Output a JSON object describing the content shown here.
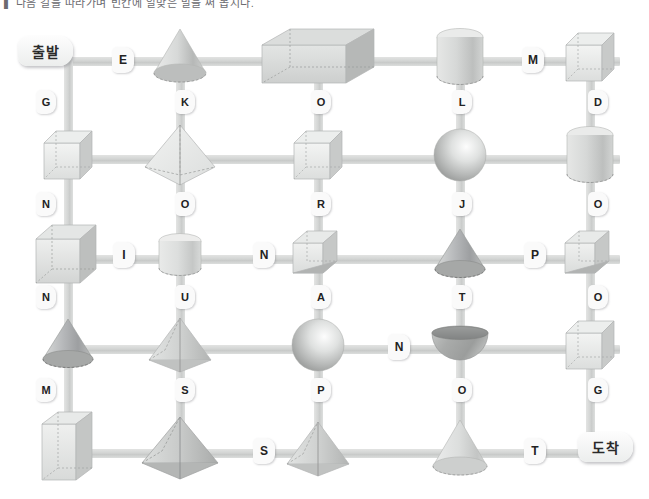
{
  "page": {
    "title_strip": "▌ 다음 길을 따라가며 빈칸에 알맞은 말을 써 봅시다.",
    "background_color": "#ffffff",
    "bar_color": "#d3d5d4",
    "chip_color": "#fafafa"
  },
  "terminals": {
    "start": {
      "label": "출발",
      "x": 18,
      "y": 36
    },
    "end": {
      "label": "도착",
      "x": 578,
      "y": 432
    }
  },
  "grid": {
    "columns": 5,
    "rows": 5,
    "column_x": [
      68,
      180,
      318,
      460,
      590
    ],
    "row_y": [
      60,
      158,
      258,
      348,
      452
    ]
  },
  "shapes": [
    {
      "row": 1,
      "col": 1,
      "kind": "none"
    },
    {
      "row": 1,
      "col": 2,
      "kind": "cone",
      "name": "cone"
    },
    {
      "row": 1,
      "col": 3,
      "kind": "cuboid-wide",
      "name": "rectangular-prism"
    },
    {
      "row": 1,
      "col": 4,
      "kind": "cylinder",
      "name": "cylinder"
    },
    {
      "row": 1,
      "col": 5,
      "kind": "cube",
      "name": "cube"
    },
    {
      "row": 2,
      "col": 1,
      "kind": "cube",
      "name": "cube"
    },
    {
      "row": 2,
      "col": 2,
      "kind": "octahedron",
      "name": "octahedron"
    },
    {
      "row": 2,
      "col": 3,
      "kind": "cube",
      "name": "cube"
    },
    {
      "row": 2,
      "col": 4,
      "kind": "sphere",
      "name": "sphere"
    },
    {
      "row": 2,
      "col": 5,
      "kind": "cylinder",
      "name": "cylinder"
    },
    {
      "row": 3,
      "col": 1,
      "kind": "cube-large",
      "name": "cube"
    },
    {
      "row": 3,
      "col": 2,
      "kind": "cylinder-short",
      "name": "cylinder"
    },
    {
      "row": 3,
      "col": 3,
      "kind": "triangular-prism",
      "name": "triangular-prism"
    },
    {
      "row": 3,
      "col": 4,
      "kind": "cone-dark",
      "name": "cone"
    },
    {
      "row": 3,
      "col": 5,
      "kind": "triangular-prism",
      "name": "triangular-prism"
    },
    {
      "row": 4,
      "col": 1,
      "kind": "cone-dark",
      "name": "cone"
    },
    {
      "row": 4,
      "col": 2,
      "kind": "pyramid",
      "name": "square-pyramid"
    },
    {
      "row": 4,
      "col": 3,
      "kind": "sphere",
      "name": "sphere"
    },
    {
      "row": 4,
      "col": 4,
      "kind": "hemisphere",
      "name": "hemisphere"
    },
    {
      "row": 4,
      "col": 5,
      "kind": "cube",
      "name": "cube"
    },
    {
      "row": 5,
      "col": 1,
      "kind": "cuboid-tall",
      "name": "rectangular-prism"
    },
    {
      "row": 5,
      "col": 2,
      "kind": "pyramid-big",
      "name": "square-pyramid"
    },
    {
      "row": 5,
      "col": 3,
      "kind": "pyramid",
      "name": "square-pyramid"
    },
    {
      "row": 5,
      "col": 4,
      "kind": "cone-tall",
      "name": "cone"
    },
    {
      "row": 5,
      "col": 5,
      "kind": "none"
    }
  ],
  "horizontal_labels": [
    {
      "id": "h-r1-1",
      "letter": "E",
      "row": 1,
      "x": 112,
      "y": 47
    },
    {
      "id": "h-r1-2",
      "letter": "M",
      "row": 1,
      "x": 522,
      "y": 47
    },
    {
      "id": "h-r3-1",
      "letter": "I",
      "row": 3,
      "x": 113,
      "y": 242
    },
    {
      "id": "h-r3-2",
      "letter": "N",
      "row": 3,
      "x": 253,
      "y": 242
    },
    {
      "id": "h-r3-3",
      "letter": "P",
      "row": 3,
      "x": 524,
      "y": 242
    },
    {
      "id": "h-r4-1",
      "letter": "N",
      "row": 4,
      "x": 388,
      "y": 334
    },
    {
      "id": "h-r5-1",
      "letter": "S",
      "row": 5,
      "x": 253,
      "y": 438
    },
    {
      "id": "h-r5-2",
      "letter": "T",
      "row": 5,
      "x": 524,
      "y": 438
    }
  ],
  "vertical_labels": [
    {
      "id": "v-1-1",
      "letter": "G",
      "col": 1,
      "x": 36,
      "y": 90
    },
    {
      "id": "v-1-2",
      "letter": "K",
      "col": 2,
      "x": 175,
      "y": 90
    },
    {
      "id": "v-1-3",
      "letter": "O",
      "col": 3,
      "x": 311,
      "y": 90
    },
    {
      "id": "v-1-4",
      "letter": "L",
      "col": 4,
      "x": 452,
      "y": 90
    },
    {
      "id": "v-1-5",
      "letter": "D",
      "col": 5,
      "x": 588,
      "y": 90
    },
    {
      "id": "v-2-1",
      "letter": "N",
      "col": 1,
      "x": 36,
      "y": 192
    },
    {
      "id": "v-2-2",
      "letter": "O",
      "col": 2,
      "x": 175,
      "y": 192
    },
    {
      "id": "v-2-3",
      "letter": "R",
      "col": 3,
      "x": 311,
      "y": 192
    },
    {
      "id": "v-2-4",
      "letter": "J",
      "col": 4,
      "x": 452,
      "y": 192
    },
    {
      "id": "v-2-5",
      "letter": "O",
      "col": 5,
      "x": 588,
      "y": 192
    },
    {
      "id": "v-3-1",
      "letter": "N",
      "col": 1,
      "x": 36,
      "y": 285
    },
    {
      "id": "v-3-2",
      "letter": "U",
      "col": 2,
      "x": 175,
      "y": 285
    },
    {
      "id": "v-3-3",
      "letter": "A",
      "col": 3,
      "x": 311,
      "y": 285
    },
    {
      "id": "v-3-4",
      "letter": "T",
      "col": 4,
      "x": 452,
      "y": 285
    },
    {
      "id": "v-3-5",
      "letter": "O",
      "col": 5,
      "x": 588,
      "y": 285
    },
    {
      "id": "v-4-1",
      "letter": "M",
      "col": 1,
      "x": 36,
      "y": 378
    },
    {
      "id": "v-4-2",
      "letter": "S",
      "col": 2,
      "x": 175,
      "y": 378
    },
    {
      "id": "v-4-3",
      "letter": "P",
      "col": 3,
      "x": 311,
      "y": 378
    },
    {
      "id": "v-4-4",
      "letter": "O",
      "col": 4,
      "x": 452,
      "y": 378
    },
    {
      "id": "v-4-5",
      "letter": "G",
      "col": 5,
      "x": 588,
      "y": 378
    }
  ]
}
